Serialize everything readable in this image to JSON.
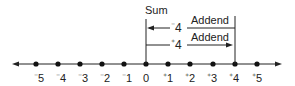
{
  "diagram": {
    "title_label": "Sum",
    "top_arrow": {
      "value": "4",
      "sign": "⁻",
      "label": "Addend"
    },
    "bottom_arrow": {
      "value": "4",
      "sign": "⁺",
      "label": "Addend"
    },
    "ticks": [
      {
        "sign": "⁻",
        "num": "5"
      },
      {
        "sign": "⁻",
        "num": "4"
      },
      {
        "sign": "⁻",
        "num": "3"
      },
      {
        "sign": "⁻",
        "num": "2"
      },
      {
        "sign": "⁻",
        "num": "1"
      },
      {
        "sign": "",
        "num": "0"
      },
      {
        "sign": "⁺",
        "num": "1"
      },
      {
        "sign": "⁺",
        "num": "2"
      },
      {
        "sign": "⁺",
        "num": "3"
      },
      {
        "sign": "⁺",
        "num": "4"
      },
      {
        "sign": "⁺",
        "num": "5"
      }
    ],
    "colors": {
      "ink": "#222222",
      "background": "#ffffff"
    }
  }
}
